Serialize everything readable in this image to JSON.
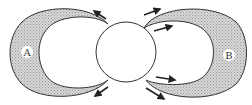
{
  "diagram": {
    "labels": {
      "left_lobe": "A",
      "right_lobe": "B"
    },
    "colors": {
      "outline": "#333333",
      "lobe_fill": "#c8c8c8",
      "background": "#ffffff",
      "arrow": "#222222"
    },
    "elements": {
      "central_circle": {
        "cx": 126,
        "cy": 52,
        "r": 30
      },
      "left_lobe": {
        "label": "A",
        "shaded": true
      },
      "right_lobe": {
        "label": "B",
        "shaded": true
      },
      "arrows": [
        {
          "position": "top-left",
          "direction": "up-left"
        },
        {
          "position": "bottom-left",
          "direction": "down-left"
        },
        {
          "position": "top-right-outer",
          "direction": "up-right"
        },
        {
          "position": "top-right-inner",
          "direction": "right"
        },
        {
          "position": "bottom-right-inner",
          "direction": "right"
        },
        {
          "position": "bottom-right-outer",
          "direction": "down-right"
        }
      ]
    }
  }
}
